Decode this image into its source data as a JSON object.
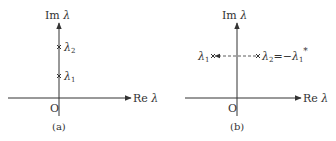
{
  "figure": {
    "panels": [
      {
        "id": "a",
        "caption": "(a)",
        "y_axis_label_prefix": "Im",
        "x_axis_label_prefix": "Re",
        "axis_symbol": "λ",
        "origin": "O",
        "points": [
          {
            "name": "λ",
            "sub": "2",
            "position": "upper on imaginary axis"
          },
          {
            "name": "λ",
            "sub": "1",
            "position": "lower on imaginary axis"
          }
        ]
      },
      {
        "id": "b",
        "caption": "(b)",
        "y_axis_label_prefix": "Im",
        "x_axis_label_prefix": "Re",
        "axis_symbol": "λ",
        "origin": "O",
        "points": [
          {
            "name": "λ",
            "sub": "1",
            "position": "left half-plane"
          },
          {
            "name": "λ",
            "sub": "2",
            "relation": "=−",
            "rel_name": "λ",
            "rel_sub": "1",
            "rel_sup": "*",
            "position": "right half-plane"
          }
        ]
      }
    ],
    "colors": {
      "ink": "#333333",
      "background": "#ffffff"
    }
  }
}
